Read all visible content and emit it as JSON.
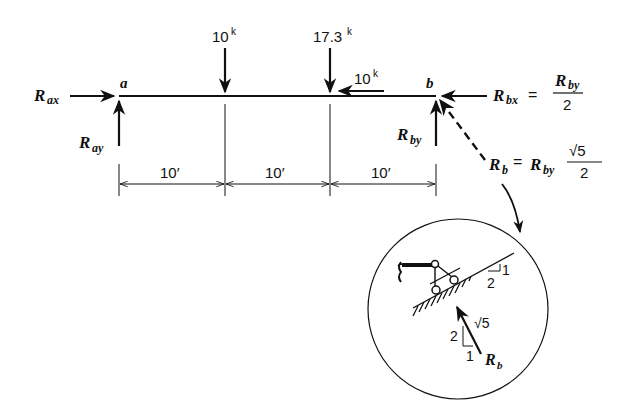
{
  "diagram": {
    "type": "free-body diagram of a simply supported beam",
    "beam": {
      "left_end_label": "a",
      "right_end_label": "b",
      "spans": [
        "10′",
        "10′",
        "10′"
      ]
    },
    "loads": [
      {
        "value": "10",
        "unit": "k",
        "direction": "down",
        "position": "10′ from a"
      },
      {
        "value": "17.3",
        "unit": "k",
        "direction": "down",
        "position": "20′ from a"
      },
      {
        "value": "10",
        "unit": "k",
        "direction": "left",
        "position": "20′ from a"
      }
    ],
    "reactions": {
      "rax": {
        "main": "R",
        "sub": "ax",
        "direction": "right"
      },
      "ray": {
        "main": "R",
        "sub": "ay",
        "direction": "up"
      },
      "rby": {
        "main": "R",
        "sub": "by",
        "direction": "up"
      },
      "rbx": {
        "main": "R",
        "sub": "bx",
        "direction": "left",
        "equation_rhs_num_main": "R",
        "equation_rhs_num_sub": "by",
        "equation_rhs_den": "2",
        "eq": "="
      },
      "rb": {
        "main": "R",
        "sub": "b",
        "direction": "inclined (dashed)",
        "eq": "=",
        "rhs_main": "R",
        "rhs_sub": "by",
        "rhs_num": "√5",
        "rhs_den": "2"
      }
    },
    "detail": {
      "description": "Roller support on 1:2 inclined surface",
      "slope_rise": "1",
      "slope_run": "2",
      "force_triangle_vertical": "2",
      "force_triangle_horizontal": "1",
      "force_triangle_hyp": "√5",
      "force_label_main": "R",
      "force_label_sub": "b"
    },
    "labels": {
      "k": "k",
      "sqrt": "√",
      "five": "5"
    }
  }
}
